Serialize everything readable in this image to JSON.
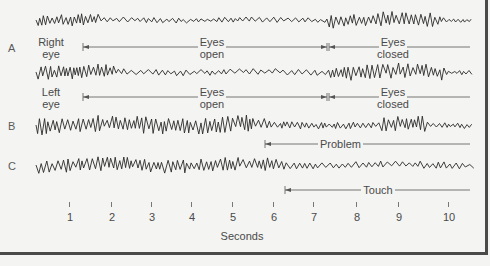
{
  "figure": {
    "rows": [
      {
        "letter": "A",
        "traces": [
          {
            "name": "Right eye",
            "label_line1": "Right",
            "label_line2": "eye"
          },
          {
            "name": "Left eye",
            "label_line1": "Left",
            "label_line2": "eye"
          }
        ]
      },
      {
        "letter": "B",
        "marker": "Problem"
      },
      {
        "letter": "C",
        "marker": "Touch"
      }
    ],
    "annotations": {
      "eyes_open_line1": "Eyes",
      "eyes_open_line2": "open",
      "eyes_closed_line1": "Eyes",
      "eyes_closed_line2": "closed",
      "problem": "Problem",
      "touch": "Touch"
    },
    "x_axis": {
      "title": "Seconds",
      "ticks": [
        "1",
        "2",
        "3",
        "4",
        "5",
        "6",
        "7",
        "8",
        "9",
        "10"
      ]
    },
    "colors": {
      "background": "#f4f4f2",
      "trace": "#2a2a2a",
      "frame": "#4a4a4a"
    }
  },
  "chart_data": {
    "type": "line",
    "title": "",
    "xlabel": "Seconds",
    "ylabel": "",
    "x_range": [
      0.2,
      10.5
    ],
    "x_ticks": [
      1,
      2,
      3,
      4,
      5,
      6,
      7,
      8,
      9,
      10
    ],
    "series": [
      {
        "name": "A - Right eye",
        "events": [
          {
            "label": "Eyes open",
            "start": 1.35,
            "end": 7.35
          },
          {
            "label": "Eyes closed",
            "start": 7.35,
            "end": 10.5
          }
        ]
      },
      {
        "name": "A - Left eye",
        "events": [
          {
            "label": "Eyes open",
            "start": 1.35,
            "end": 7.35
          },
          {
            "label": "Eyes closed",
            "start": 7.35,
            "end": 10.5
          }
        ]
      },
      {
        "name": "B",
        "events": [
          {
            "label": "Problem",
            "start": 5.85,
            "end": 10.5
          }
        ]
      },
      {
        "name": "C",
        "events": [
          {
            "label": "Touch",
            "start": 6.3,
            "end": 10.5
          }
        ]
      }
    ]
  }
}
